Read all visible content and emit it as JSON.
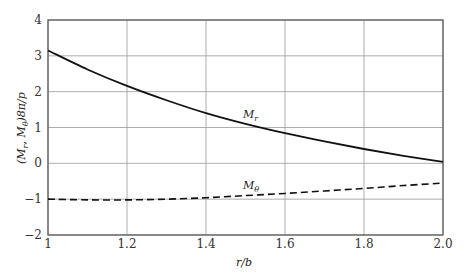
{
  "chart_data": {
    "type": "line",
    "title": "",
    "xlabel": "r/b",
    "ylabel": "(M_r, M_θ)8π/p",
    "xlim": [
      1.0,
      2.0
    ],
    "ylim": [
      -2,
      4
    ],
    "grid": true,
    "legend": "none (inline curve labels)",
    "x_ticks": [
      "1",
      "1.2",
      "1.4",
      "1.6",
      "1.8",
      "2.0"
    ],
    "y_ticks": [
      "4",
      "3",
      "2",
      "1",
      "0",
      "−1",
      "−2"
    ],
    "x": [
      1.0,
      1.1,
      1.2,
      1.3,
      1.4,
      1.5,
      1.6,
      1.7,
      1.8,
      1.9,
      2.0
    ],
    "series": [
      {
        "name": "M_r",
        "style": "solid",
        "values": [
          3.15,
          2.62,
          2.16,
          1.76,
          1.4,
          1.1,
          0.84,
          0.61,
          0.4,
          0.21,
          0.04
        ],
        "annotation": {
          "text": "M_r",
          "x": 1.51,
          "y": 1.25
        }
      },
      {
        "name": "M_θ",
        "style": "dashed",
        "values": [
          -1.0,
          -1.02,
          -1.02,
          -1.0,
          -0.96,
          -0.9,
          -0.84,
          -0.77,
          -0.7,
          -0.62,
          -0.55
        ],
        "annotation": {
          "text": "M_θ",
          "x": 1.51,
          "y": -0.6
        }
      }
    ]
  },
  "labels": {
    "xlabel_main": "r/b",
    "ylabel_main": "(M",
    "ylabel_sub_r": "r",
    "ylabel_mid": ", M",
    "ylabel_sub_theta": "θ",
    "ylabel_tail": ")8π/p",
    "mr_main": "M",
    "mr_sub": "r",
    "mt_main": "M",
    "mt_sub": "θ"
  }
}
